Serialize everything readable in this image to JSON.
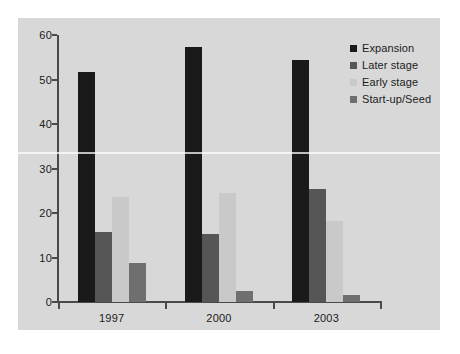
{
  "chart_data": {
    "type": "bar",
    "title": "",
    "xlabel": "",
    "ylabel": "",
    "categories": [
      "1997",
      "2000",
      "2003"
    ],
    "ylim": [
      0,
      60
    ],
    "yticks": [
      0,
      10,
      20,
      30,
      40,
      50,
      60
    ],
    "grid": false,
    "legend_position": "top-right",
    "series": [
      {
        "name": "Expansion",
        "color": "#1a1a1a",
        "values": [
          51.8,
          57.4,
          54.3
        ]
      },
      {
        "name": "Later stage",
        "color": "#565656",
        "values": [
          15.7,
          15.2,
          25.3
        ]
      },
      {
        "name": "Early stage",
        "color": "#c9c9c9",
        "values": [
          23.7,
          24.6,
          18.2
        ]
      },
      {
        "name": "Start-up/Seed",
        "color": "#6f6f6f",
        "values": [
          8.8,
          2.5,
          1.6
        ]
      }
    ]
  },
  "figure": {
    "panel_color": "#d8d8d8",
    "background_color": "#ffffff",
    "axis_color": "#4a4a4a",
    "text_color": "#1b1b1b"
  }
}
